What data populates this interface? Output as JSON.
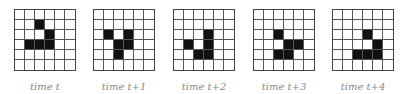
{
  "figure": {
    "rows": 6,
    "cols": 6,
    "fill_color": "#111111",
    "panels": [
      {
        "label": "time t",
        "left": 14,
        "cells": [
          [
            1,
            2
          ],
          [
            2,
            3
          ],
          [
            3,
            1
          ],
          [
            3,
            2
          ],
          [
            3,
            3
          ]
        ]
      },
      {
        "label": "time t+1",
        "left": 93,
        "cells": [
          [
            2,
            1
          ],
          [
            2,
            3
          ],
          [
            3,
            2
          ],
          [
            3,
            3
          ],
          [
            4,
            2
          ]
        ]
      },
      {
        "label": "time t+2",
        "left": 173,
        "cells": [
          [
            2,
            3
          ],
          [
            3,
            1
          ],
          [
            3,
            3
          ],
          [
            4,
            2
          ],
          [
            4,
            3
          ]
        ]
      },
      {
        "label": "time t+3",
        "left": 253,
        "cells": [
          [
            2,
            2
          ],
          [
            3,
            3
          ],
          [
            3,
            4
          ],
          [
            4,
            2
          ],
          [
            4,
            3
          ]
        ]
      },
      {
        "label": "time t+4",
        "left": 332,
        "cells": [
          [
            2,
            3
          ],
          [
            3,
            4
          ],
          [
            4,
            2
          ],
          [
            4,
            3
          ],
          [
            4,
            4
          ]
        ]
      }
    ]
  }
}
